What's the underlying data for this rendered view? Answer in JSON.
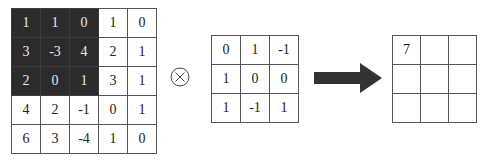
{
  "input_matrix": {
    "rows": [
      [
        "1",
        "1",
        "0",
        "1",
        "0"
      ],
      [
        "3",
        "-3",
        "4",
        "2",
        "1"
      ],
      [
        "2",
        "0",
        "1",
        "3",
        "1"
      ],
      [
        "4",
        "2",
        "-1",
        "0",
        "1"
      ],
      [
        "6",
        "3",
        "-4",
        "1",
        "0"
      ]
    ],
    "highlighted_window": "top-left 3x3"
  },
  "operator": {
    "symbol": "⊗",
    "icon": "circled-times-icon"
  },
  "kernel_matrix": {
    "rows": [
      [
        "0",
        "1",
        "-1"
      ],
      [
        "1",
        "0",
        "0"
      ],
      [
        "1",
        "-1",
        "1"
      ]
    ]
  },
  "arrow": {
    "icon": "right-arrow-icon"
  },
  "output_matrix": {
    "rows": [
      [
        "7",
        "",
        ""
      ],
      [
        "",
        "",
        ""
      ],
      [
        "",
        "",
        ""
      ]
    ]
  },
  "colors": {
    "highlight_fill": "#2b2b2b",
    "highlight_text": "#e8e8e8",
    "grid_line": "#555555",
    "arrow_fill": "#333333"
  }
}
